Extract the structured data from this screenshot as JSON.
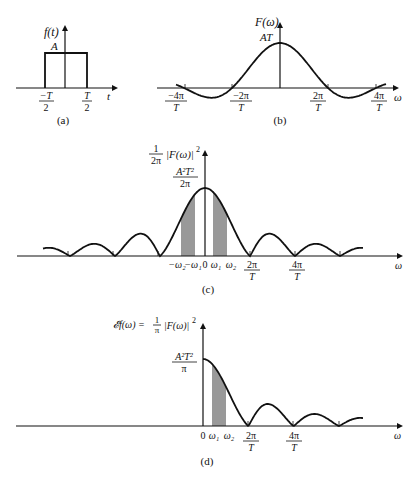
{
  "figure": {
    "panels": [
      {
        "id": "a",
        "caption": "(a)",
        "ylabel": "f(t)",
        "xlabel": "t",
        "amplitude_label": "A",
        "ticks": [
          {
            "num": "−T",
            "den": "2"
          },
          {
            "num": "T",
            "den": "2"
          }
        ]
      },
      {
        "id": "b",
        "caption": "(b)",
        "ylabel": "F(ω)",
        "xlabel": "ω",
        "peak_label": "AT",
        "ticks": [
          {
            "num": "−4π",
            "den": "T"
          },
          {
            "num": "−2π",
            "den": "T"
          },
          {
            "num": "2π",
            "den": "T"
          },
          {
            "num": "4π",
            "den": "T"
          }
        ]
      },
      {
        "id": "c",
        "caption": "(c)",
        "ylabel_frac": {
          "num": "1",
          "den": "2π"
        },
        "ylabel_rest": "|F(ω)|",
        "ylabel_sup": "2",
        "xlabel": "ω",
        "peak_label": {
          "num": "A²T²",
          "den": "2π"
        },
        "ticks_plain": [
          "−ω₂",
          "−ω₁",
          "0",
          "ω₁",
          "ω₂"
        ],
        "ticks": [
          {
            "num": "2π",
            "den": "T"
          },
          {
            "num": "4π",
            "den": "T"
          }
        ]
      },
      {
        "id": "d",
        "caption": "(d)",
        "ylabel_left": "𝓔f(ω) =",
        "ylabel_frac": {
          "num": "1",
          "den": "π"
        },
        "ylabel_rest": "|F(ω)|",
        "ylabel_sup": "2",
        "xlabel": "ω",
        "peak_label": {
          "num": "A²T²",
          "den": "π"
        },
        "ticks_plain": [
          "0",
          "ω₁",
          "ω₂"
        ],
        "ticks": [
          {
            "num": "2π",
            "den": "T"
          },
          {
            "num": "4π",
            "den": "T"
          }
        ]
      }
    ]
  }
}
